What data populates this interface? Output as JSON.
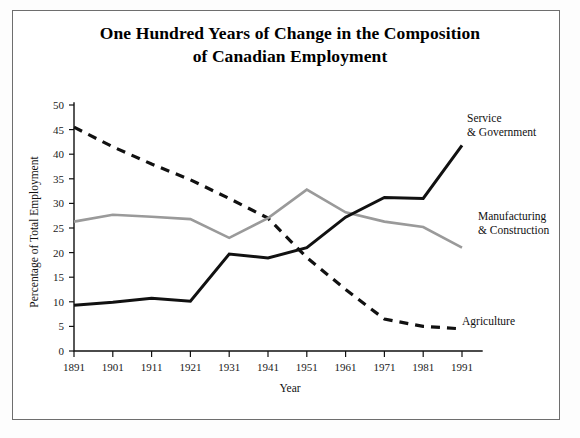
{
  "chart_data": {
    "type": "line",
    "title": "One Hundred Years of Change in the Composition of Canadian Employment",
    "title_line1": "One Hundred Years of Change in the Composition",
    "title_line2": "of Canadian Employment",
    "xlabel": "Year",
    "ylabel": "Percentage of Total Employment",
    "x": [
      1891,
      1901,
      1911,
      1921,
      1931,
      1941,
      1951,
      1961,
      1971,
      1981,
      1991
    ],
    "categories": [
      "1891",
      "1901",
      "1911",
      "1921",
      "1931",
      "1941",
      "1951",
      "1961",
      "1971",
      "1981",
      "1991"
    ],
    "xlim": [
      1891,
      1991
    ],
    "ylim": [
      0,
      50
    ],
    "ytick_values": [
      0,
      5,
      10,
      15,
      20,
      25,
      30,
      35,
      40,
      45,
      50
    ],
    "ytick_labels": [
      "0",
      "5",
      "10",
      "15",
      "20",
      "25",
      "30",
      "35",
      "40",
      "45",
      "50"
    ],
    "grid": false,
    "legend_position": "inline-annotations",
    "series": [
      {
        "name": "Agriculture",
        "label_line1": "Agriculture",
        "label_line2": "",
        "style": "dashed",
        "color": "#111111",
        "values": [
          45.5,
          41.5,
          38.0,
          34.8,
          31.0,
          27.0,
          19.0,
          12.5,
          6.5,
          5.0,
          4.5
        ]
      },
      {
        "name": "Manufacturing & Construction",
        "label_line1": "Manufacturing",
        "label_line2": "& Construction",
        "style": "solid",
        "color": "#9a9a9a",
        "values": [
          26.3,
          27.7,
          27.3,
          26.8,
          23.0,
          27.0,
          32.8,
          28.2,
          26.3,
          25.2,
          21.0
        ]
      },
      {
        "name": "Service & Government",
        "label_line1": "Service",
        "label_line2": "& Government",
        "style": "solid",
        "color": "#111111",
        "values": [
          9.3,
          9.9,
          10.7,
          10.1,
          19.7,
          18.9,
          21.0,
          27.2,
          31.2,
          31.0,
          41.8
        ]
      }
    ]
  },
  "annotations": {
    "service": {
      "line1": "Service",
      "line2": "& Government"
    },
    "manufacturing": {
      "line1": "Manufacturing",
      "line2": "& Construction"
    },
    "agriculture": {
      "line1": "Agriculture"
    }
  }
}
